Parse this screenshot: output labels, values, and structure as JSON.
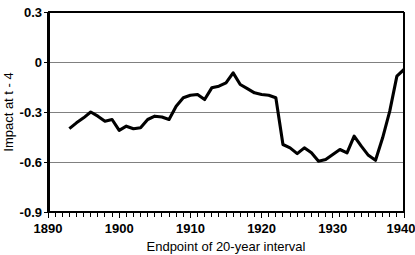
{
  "chart_data": {
    "type": "line",
    "title": "",
    "xlabel": "Endpoint of 20-year interval",
    "ylabel": "Impact at t - 4",
    "xlim": [
      1890,
      1940
    ],
    "ylim": [
      -0.9,
      0.3
    ],
    "grid": true,
    "legend": false,
    "xticks": [
      1890,
      1900,
      1910,
      1920,
      1930,
      1940
    ],
    "xtick_labels": [
      "1890",
      "1900",
      "1910",
      "1920",
      "1930",
      "1940"
    ],
    "minor_xtick_interval": 1,
    "yticks": [
      0.3,
      0,
      -0.3,
      -0.6,
      -0.9
    ],
    "ytick_labels": [
      "0.3",
      "0",
      "-0.3",
      "-0.6",
      "-0.9"
    ],
    "series": [
      {
        "name": "Impact at t - 4",
        "color": "#000000",
        "x": [
          1893,
          1894,
          1895,
          1896,
          1897,
          1898,
          1899,
          1900,
          1901,
          1902,
          1903,
          1904,
          1905,
          1906,
          1907,
          1908,
          1909,
          1910,
          1911,
          1912,
          1913,
          1914,
          1915,
          1916,
          1917,
          1918,
          1919,
          1920,
          1921,
          1922,
          1923,
          1924,
          1925,
          1926,
          1927,
          1928,
          1929,
          1930,
          1931,
          1932,
          1933,
          1934,
          1935,
          1936,
          1937,
          1938,
          1939,
          1940
        ],
        "y": [
          -0.4,
          -0.365,
          -0.335,
          -0.3,
          -0.325,
          -0.355,
          -0.345,
          -0.41,
          -0.385,
          -0.4,
          -0.395,
          -0.345,
          -0.325,
          -0.33,
          -0.345,
          -0.265,
          -0.215,
          -0.2,
          -0.195,
          -0.225,
          -0.155,
          -0.145,
          -0.125,
          -0.065,
          -0.135,
          -0.16,
          -0.185,
          -0.195,
          -0.2,
          -0.215,
          -0.495,
          -0.515,
          -0.55,
          -0.515,
          -0.545,
          -0.595,
          -0.585,
          -0.555,
          -0.525,
          -0.545,
          -0.445,
          -0.505,
          -0.56,
          -0.59,
          -0.455,
          -0.295,
          -0.085,
          -0.045
        ]
      }
    ]
  },
  "axes": {
    "y_axis_title": "Impact at t - 4",
    "x_axis_title": "Endpoint of 20-year interval",
    "y_labels": [
      "0.3",
      "0",
      "-0.3",
      "-0.6",
      "-0.9"
    ],
    "x_labels": [
      "1890",
      "1900",
      "1910",
      "1920",
      "1930",
      "1940"
    ]
  }
}
